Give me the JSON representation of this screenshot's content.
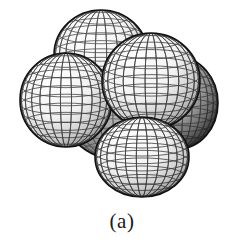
{
  "figure": {
    "caption": "(a)",
    "background_color": "#ffffff",
    "width": 244,
    "height": 243,
    "render_style": "wireframe-mesh-shaded",
    "mesh_line_color": "#1c1c1c",
    "outline_color": "#111111"
  },
  "molecule": {
    "name": "methane",
    "formula": "CH4",
    "geometry": "tetrahedral",
    "atom_count": 5,
    "projection": "perspective",
    "atoms": [
      {
        "id": "atom-carbon-center",
        "element": "C",
        "label": "carbon",
        "role": "central",
        "cx": 120,
        "cy": 100,
        "r": 62,
        "rx": 62,
        "ry": 60,
        "depth": 0,
        "fill_light": "#cfcfcf",
        "fill_mid": "#9a9a9a",
        "fill_dark": "#4a4a4a",
        "mesh_opacity": 0.55,
        "mesh_lat": 11,
        "mesh_lon": 13
      },
      {
        "id": "atom-hydrogen-top-rear",
        "element": "H",
        "label": "hydrogen-top-rear",
        "role": "substituent",
        "cx": 101,
        "cy": 55,
        "r": 47,
        "rx": 47,
        "ry": 45,
        "depth": 1,
        "fill_light": "#fdfdfd",
        "fill_mid": "#dadada",
        "fill_dark": "#787878",
        "mesh_opacity": 0.78,
        "mesh_lat": 11,
        "mesh_lon": 13
      },
      {
        "id": "atom-hydrogen-right-rear",
        "element": "H",
        "label": "hydrogen-right-rear",
        "role": "substituent",
        "cx": 178,
        "cy": 103,
        "r": 40,
        "rx": 40,
        "ry": 46,
        "depth": 1,
        "fill_light": "#e8e8e8",
        "fill_mid": "#9e9e9e",
        "fill_dark": "#3d3d3d",
        "mesh_opacity": 0.7,
        "mesh_lat": 11,
        "mesh_lon": 13
      },
      {
        "id": "atom-hydrogen-left-front",
        "element": "H",
        "label": "hydrogen-left-front",
        "role": "substituent",
        "cx": 66,
        "cy": 100,
        "r": 47,
        "rx": 46,
        "ry": 47,
        "depth": 2,
        "fill_light": "#ffffff",
        "fill_mid": "#e2e2e2",
        "fill_dark": "#8a8a8a",
        "mesh_opacity": 0.82,
        "mesh_lat": 11,
        "mesh_lon": 13
      },
      {
        "id": "atom-hydrogen-upper-front",
        "element": "H",
        "label": "hydrogen-upper-front",
        "role": "substituent",
        "cx": 151,
        "cy": 81,
        "r": 49,
        "rx": 49,
        "ry": 48,
        "depth": 3,
        "fill_light": "#ffffff",
        "fill_mid": "#e6e6e6",
        "fill_dark": "#8f8f8f",
        "mesh_opacity": 0.84,
        "mesh_lat": 11,
        "mesh_lon": 13
      },
      {
        "id": "atom-hydrogen-bottom-front",
        "element": "H",
        "label": "hydrogen-bottom-front",
        "role": "substituent",
        "cx": 142,
        "cy": 157,
        "r": 47,
        "rx": 47,
        "ry": 40,
        "depth": 3,
        "fill_light": "#ffffff",
        "fill_mid": "#e4e4e4",
        "fill_dark": "#8c8c8c",
        "mesh_opacity": 0.84,
        "mesh_lat": 11,
        "mesh_lon": 13
      }
    ]
  }
}
